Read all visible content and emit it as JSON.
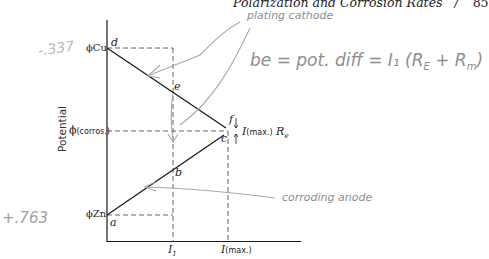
{
  "header": {
    "title": "Polarization and Corrosion Rates",
    "separator": "/",
    "page_number": "85"
  },
  "diagram": {
    "y_axis_label": "Potential",
    "y_ticks": {
      "phi_cu": "ϕCu",
      "phi_corros_symbol": "ϕ",
      "phi_corros_sub": "(corros.)",
      "phi_zn": "ϕZn"
    },
    "x_ticks": {
      "i1_main": "I",
      "i1_sub": "1",
      "imax_main": "I",
      "imax_sub": "(max.)"
    },
    "points": {
      "a": "a",
      "b": "b",
      "c": "c",
      "d": "d",
      "e": "e",
      "f": "f"
    },
    "ir_drop_label": {
      "main": "I",
      "sub": "(max.)",
      "suffix": "R",
      "suffix_sub": "e"
    },
    "lines": [
      {
        "name": "cathode-polarization",
        "from": "d",
        "to": "f"
      },
      {
        "name": "anode-polarization",
        "from": "a",
        "to": "c"
      }
    ]
  },
  "annotations": {
    "cathode_note": "plating cathode",
    "anode_note": "corroding anode",
    "equation": "be = pot. diff = I₁ (R",
    "equation_sub1": "E",
    "equation_mid": " + R",
    "equation_sub2": "m",
    "equation_end": ")",
    "margin_top": "-.337",
    "margin_bottom": "+.763"
  },
  "colors": {
    "ink": "#1a1a1a",
    "pencil": "#8e8e8e",
    "dashes": "#555555"
  }
}
